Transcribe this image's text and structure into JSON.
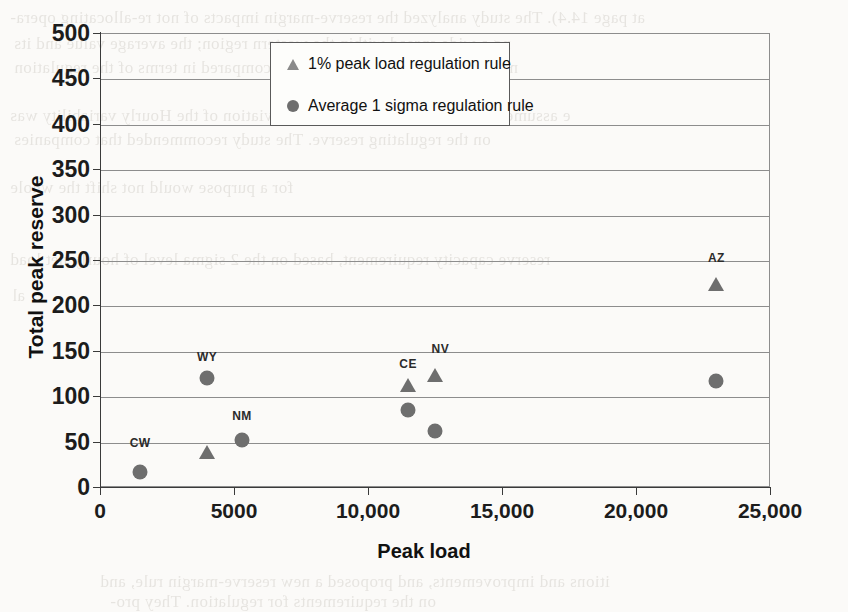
{
  "chart_data": {
    "type": "scatter",
    "title": "",
    "xlabel": "Peak load",
    "ylabel": "Total peak reserve",
    "xlim": [
      0,
      25000
    ],
    "ylim": [
      0,
      500
    ],
    "grid": true,
    "legend_position": "top-center",
    "x_ticks": [
      {
        "value": 0,
        "label": "0"
      },
      {
        "value": 5000,
        "label": "5000"
      },
      {
        "value": 10000,
        "label": "10,000"
      },
      {
        "value": 15000,
        "label": "15,000"
      },
      {
        "value": 20000,
        "label": "20,000"
      },
      {
        "value": 25000,
        "label": "25,000"
      }
    ],
    "y_ticks": [
      {
        "value": 0,
        "label": "0"
      },
      {
        "value": 50,
        "label": "50"
      },
      {
        "value": 100,
        "label": "100"
      },
      {
        "value": 150,
        "label": "150"
      },
      {
        "value": 200,
        "label": "200"
      },
      {
        "value": 250,
        "label": "250"
      },
      {
        "value": 300,
        "label": "300"
      },
      {
        "value": 350,
        "label": "350"
      },
      {
        "value": 400,
        "label": "400"
      },
      {
        "value": 450,
        "label": "450"
      },
      {
        "value": 500,
        "label": "500"
      }
    ],
    "series": [
      {
        "name": "1% peak load regulation rule",
        "marker": "triangle",
        "color": "#6e6e6e",
        "points": [
          {
            "label": "CW",
            "x": 4000,
            "y": 38
          },
          {
            "label": "CE",
            "x": 11500,
            "y": 112
          },
          {
            "label": "NV",
            "x": 12500,
            "y": 123
          },
          {
            "label": "AZ",
            "x": 23000,
            "y": 224
          }
        ]
      },
      {
        "name": "Average 1 sigma regulation rule",
        "marker": "circle",
        "color": "#6e6e6e",
        "points": [
          {
            "label": "CW",
            "x": 1500,
            "y": 17
          },
          {
            "label": "WY",
            "x": 4000,
            "y": 120
          },
          {
            "label": "NM",
            "x": 5300,
            "y": 52
          },
          {
            "label": "CE",
            "x": 11500,
            "y": 85
          },
          {
            "label": "NV",
            "x": 12500,
            "y": 62
          },
          {
            "label": "AZ",
            "x": 23000,
            "y": 117
          }
        ]
      }
    ],
    "point_labels": [
      {
        "text": "CW",
        "x": 1500,
        "y": 48
      },
      {
        "text": "WY",
        "x": 4000,
        "y": 143
      },
      {
        "text": "NM",
        "x": 5300,
        "y": 78
      },
      {
        "text": "CE",
        "x": 11500,
        "y": 135
      },
      {
        "text": "NV",
        "x": 12700,
        "y": 152
      },
      {
        "text": "AZ",
        "x": 23000,
        "y": 252
      }
    ]
  },
  "legend": {
    "entries": [
      {
        "label": "1% peak load regulation rule"
      },
      {
        "label": "Average 1 sigma regulation rule"
      }
    ]
  },
  "background_text": [
    {
      "text": "at page 14.4).  The study analyzed the reserve-margin impacts of not re-allocating opera-",
      "x": 10,
      "y": 8,
      "size": 17
    },
    {
      "text": "ng a wide spread within the western region; the average value and its",
      "x": 14,
      "y": 34,
      "size": 17
    },
    {
      "text": "ng goal, which was evaluated and compared in terms of the regulation",
      "x": 14,
      "y": 58,
      "size": 17
    },
    {
      "text": "e assumed that these operating reserve deviation of the Hourly variability was",
      "x": 10,
      "y": 106,
      "size": 17
    },
    {
      "text": "on the regulating reserve.  The study recommended that companies",
      "x": 14,
      "y": 130,
      "size": 17
    },
    {
      "text": "for a purpose would not shift the whole",
      "x": 10,
      "y": 178,
      "size": 17
    },
    {
      "text": "reserve capacity requirement, based on the 2 sigma level of hourly net load",
      "x": 10,
      "y": 250,
      "size": 17
    },
    {
      "text": "al",
      "x": 12,
      "y": 286,
      "size": 17
    },
    {
      "text": "itions and improvements, and proposed a new reserve-margin rule, and",
      "x": 100,
      "y": 572,
      "size": 17
    },
    {
      "text": "on the requirements for regulation.  They pro-",
      "x": 110,
      "y": 592,
      "size": 17
    }
  ]
}
